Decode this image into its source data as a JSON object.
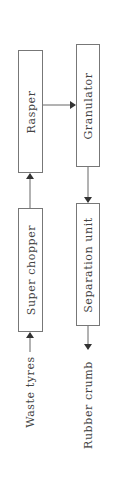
{
  "diagram": {
    "type": "process-flow",
    "orientation": "rotated-90-ccw",
    "nodes": [
      {
        "id": "super_chopper",
        "label": "Super chopper"
      },
      {
        "id": "rasper",
        "label": "Rasper"
      },
      {
        "id": "granulator",
        "label": "Granulator"
      },
      {
        "id": "separation_unit",
        "label": "Separation unit"
      }
    ],
    "input_label": "Waste tyres",
    "output_label": "Rubber crumb",
    "edges": [
      {
        "from": "Waste tyres",
        "to": "super_chopper"
      },
      {
        "from": "super_chopper",
        "to": "rasper"
      },
      {
        "from": "rasper",
        "to": "granulator"
      },
      {
        "from": "granulator",
        "to": "separation_unit"
      },
      {
        "from": "separation_unit",
        "to": "Rubber crumb"
      }
    ],
    "colors": {
      "line": "#555555",
      "text": "#444444",
      "background": "#ffffff"
    }
  }
}
